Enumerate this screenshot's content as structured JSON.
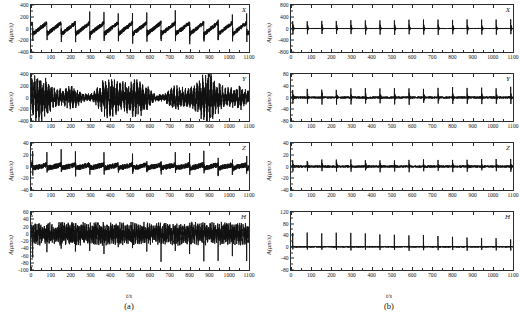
{
  "figure": {
    "xlabel": "t/s",
    "ylabel": "A(μm/s)",
    "xlim": [
      0,
      1100
    ],
    "xticks": [
      0,
      100,
      200,
      300,
      400,
      500,
      600,
      700,
      800,
      900,
      1000,
      1100
    ],
    "columns": [
      {
        "caption": "(a)"
      },
      {
        "caption": "(b)"
      }
    ]
  },
  "chart_data": [
    {
      "type": "line",
      "title": "",
      "panel": "X",
      "column": "(a)",
      "xlabel": "t/s",
      "ylabel": "A(μm/s)",
      "xlim": [
        0,
        1100
      ],
      "ylim": [
        -400,
        400
      ],
      "yticks": [
        400,
        200,
        0,
        -200,
        -400
      ],
      "xticks": [
        0,
        100,
        200,
        300,
        400,
        500,
        600,
        700,
        800,
        900,
        1000,
        1100
      ],
      "grid": false,
      "description": "Quasi-periodic impulsive bursts with sawtooth-like decay, period about 72 s, spikes reaching +400 and -400 μm/s",
      "burst_period_s": 72,
      "burst_times_s": [
        8,
        80,
        152,
        224,
        296,
        368,
        440,
        512,
        584,
        656,
        728,
        800,
        872,
        944,
        1016
      ],
      "peak_amplitude": 400,
      "baseline_noise": 40
    },
    {
      "type": "line",
      "panel": "Y",
      "column": "(a)",
      "xlabel": "t/s",
      "ylabel": "A(μm/s)",
      "xlim": [
        0,
        1100
      ],
      "ylim": [
        -400,
        400
      ],
      "yticks": [
        400,
        200,
        0,
        -200,
        -400
      ],
      "xticks": [
        0,
        100,
        200,
        300,
        400,
        500,
        600,
        700,
        800,
        900,
        1000,
        1100
      ],
      "grid": false,
      "description": "Irregular broadband oscillation filling band ±250 μm/s, larger excursions near 450-500 s and 850-950 s",
      "peak_amplitude": 330,
      "baseline_noise": 160
    },
    {
      "type": "line",
      "panel": "Z",
      "column": "(a)",
      "xlabel": "t/s",
      "ylabel": "A(μm/s)",
      "xlim": [
        0,
        1100
      ],
      "ylim": [
        -40,
        40
      ],
      "yticks": [
        40,
        20,
        0,
        -20,
        -40
      ],
      "xticks": [
        0,
        100,
        200,
        300,
        400,
        500,
        600,
        700,
        800,
        900,
        1000,
        1100
      ],
      "grid": false,
      "description": "Regular narrow impulsive bursts on low-noise baseline, period about 72 s, peaks near ±25 μm/s with one spike to 40",
      "burst_period_s": 72,
      "peak_amplitude": 28,
      "baseline_noise": 5
    },
    {
      "type": "line",
      "panel": "H",
      "column": "(a)",
      "xlabel": "t/s",
      "ylabel": "A(μm/s)",
      "xlim": [
        0,
        1100
      ],
      "ylim": [
        -100,
        60
      ],
      "yticks": [
        60,
        40,
        20,
        0,
        -20,
        -40,
        -60,
        -80,
        -100
      ],
      "xticks": [
        0,
        100,
        200,
        300,
        400,
        500,
        600,
        700,
        800,
        900,
        1000,
        1100
      ],
      "grid": false,
      "description": "Dense continuous noise band about ±25 μm/s with downward spikes to -100 μm/s at burst times",
      "peak_amplitude": 45,
      "baseline_noise": 22,
      "negative_spike_depth": -100
    },
    {
      "type": "line",
      "panel": "X",
      "column": "(b)",
      "xlabel": "t/s",
      "ylabel": "A(μm/s)",
      "xlim": [
        0,
        1100
      ],
      "ylim": [
        -800,
        800
      ],
      "yticks": [
        800,
        400,
        0,
        -400,
        -800
      ],
      "xticks": [
        0,
        100,
        200,
        300,
        400,
        500,
        600,
        700,
        800,
        900,
        1000,
        1100
      ],
      "grid": false,
      "description": "Sharp symmetric decaying wavelet bursts on near-zero baseline, period about 72 s, envelope peaks near ±400 with maxima to ±700",
      "burst_period_s": 72,
      "peak_amplitude": 420,
      "baseline_noise": 15
    },
    {
      "type": "line",
      "panel": "Y",
      "column": "(b)",
      "xlabel": "t/s",
      "ylabel": "A(μm/s)",
      "xlim": [
        0,
        1100
      ],
      "ylim": [
        -80,
        80
      ],
      "yticks": [
        80,
        40,
        0,
        -40,
        -80
      ],
      "xticks": [
        0,
        100,
        200,
        300,
        400,
        500,
        600,
        700,
        800,
        900,
        1000,
        1100
      ],
      "grid": false,
      "description": "Periodic decaying wavelet bursts, period about 72 s, envelope peaks near ±35 μm/s",
      "burst_period_s": 72,
      "peak_amplitude": 45,
      "baseline_noise": 4
    },
    {
      "type": "line",
      "panel": "Z",
      "column": "(b)",
      "xlabel": "t/s",
      "ylabel": "A(μm/s)",
      "xlim": [
        0,
        1100
      ],
      "ylim": [
        -40,
        40
      ],
      "yticks": [
        40,
        20,
        0,
        -20,
        -40
      ],
      "xticks": [
        0,
        100,
        200,
        300,
        400,
        500,
        600,
        700,
        800,
        900,
        1000,
        1100
      ],
      "grid": false,
      "description": "Periodic decaying wavelet bursts on quiet baseline, period about 72 s, peaks near ±15 μm/s with one spike to -35",
      "burst_period_s": 72,
      "peak_amplitude": 18,
      "baseline_noise": 2
    },
    {
      "type": "line",
      "panel": "H",
      "column": "(b)",
      "xlabel": "t/s",
      "ylabel": "A(μm/s)",
      "xlim": [
        0,
        1100
      ],
      "ylim": [
        -80,
        120
      ],
      "yticks": [
        120,
        80,
        40,
        0,
        -40,
        -80
      ],
      "xticks": [
        0,
        100,
        200,
        300,
        400,
        500,
        600,
        700,
        800,
        900,
        1000,
        1100
      ],
      "grid": false,
      "description": "Flat quiet baseline with narrow bipolar spikes at each burst, upward to about 90 and downward to about -60 μm/s",
      "burst_period_s": 72,
      "peak_amplitude": 90,
      "baseline_noise": 3
    }
  ]
}
